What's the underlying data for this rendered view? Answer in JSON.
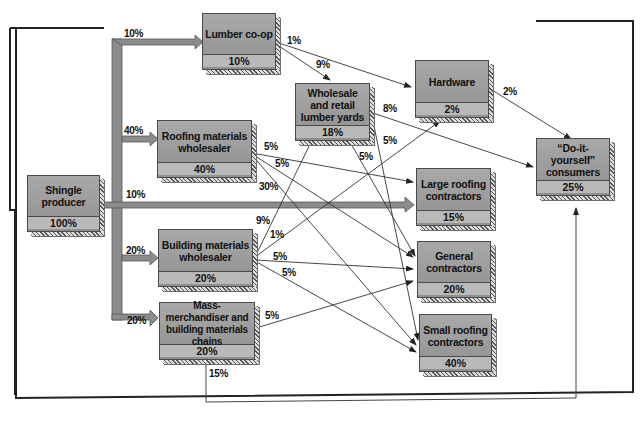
{
  "nodes": {
    "shingle_producer": {
      "name": "Shingle producer",
      "pct": "100%"
    },
    "lumber_coop": {
      "name": "Lumber co-op",
      "pct": "10%"
    },
    "roofing_wholesaler": {
      "name": "Roofing materials wholesaler",
      "pct": "40%"
    },
    "building_wholesaler": {
      "name": "Building materials wholesaler",
      "pct": "20%"
    },
    "mass_merchandiser": {
      "name": "Mass-merchandiser and building materials chains",
      "pct": "20%"
    },
    "lumber_yards": {
      "name": "Wholesale and retail lumber yards",
      "pct": "18%"
    },
    "hardware": {
      "name": "Hardware",
      "pct": "2%"
    },
    "diy_consumers": {
      "name": "“Do-it-yourself” consumers",
      "pct": "25%"
    },
    "large_roofing": {
      "name": "Large roofing contractors",
      "pct": "15%"
    },
    "general_contractors": {
      "name": "General contractors",
      "pct": "20%"
    },
    "small_roofing": {
      "name": "Small roofing contractors",
      "pct": "40%"
    }
  },
  "flows": {
    "producer_to_coop": "10%",
    "producer_to_roofing": "40%",
    "producer_to_large": "10%",
    "producer_to_building": "20%",
    "producer_to_mass": "20%",
    "coop_to_hardware": "1%",
    "coop_to_yards": "9%",
    "yards_to_diy": "8%",
    "yards_to_general": "5%",
    "yards_to_small": "5%",
    "hardware_to_diy": "2%",
    "roofing_to_large": "5%",
    "roofing_to_general": "5%",
    "roofing_to_small": "30%",
    "building_to_yards": "9%",
    "building_to_hardware": "1%",
    "building_to_general": "5%",
    "building_to_small": "5%",
    "mass_to_general": "5%",
    "mass_to_diy": "15%"
  },
  "colors": {
    "box": "#9a9a9a",
    "trunk": "#8c8c8c",
    "line": "#333333"
  }
}
